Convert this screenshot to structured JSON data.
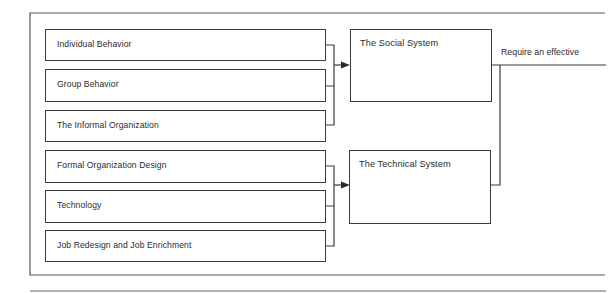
{
  "diagram": {
    "left_boxes": [
      {
        "label": "Individual Behavior",
        "group": "social"
      },
      {
        "label": "Group Behavior",
        "group": "social"
      },
      {
        "label": "The Informal Organization",
        "group": "social"
      },
      {
        "label": "Formal Organization Design",
        "group": "technical"
      },
      {
        "label": "Technology",
        "group": "technical"
      },
      {
        "label": "Job Redesign and Job Enrichment",
        "group": "technical"
      }
    ],
    "system_boxes": [
      {
        "label": "The Social System"
      },
      {
        "label": "The Technical System"
      }
    ],
    "output_label": "Require an effective",
    "line_color": "#3a3a3a"
  }
}
